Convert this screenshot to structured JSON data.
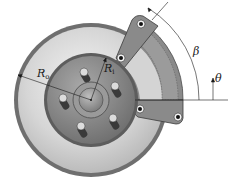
{
  "diagram": {
    "labels": {
      "outer_radius": "R",
      "outer_radius_sub": "o",
      "inner_radius": "R",
      "inner_radius_sub": "i",
      "pad_angle": "β",
      "angle": "θ"
    },
    "colors": {
      "disc_rim": "#6f6f6f",
      "disc_face": "#d9d9d9",
      "hub": "#8c8c8c",
      "pad": "#7d7d7d",
      "pad_light": "#c8c8c8",
      "line": "#1a1a1a"
    }
  }
}
